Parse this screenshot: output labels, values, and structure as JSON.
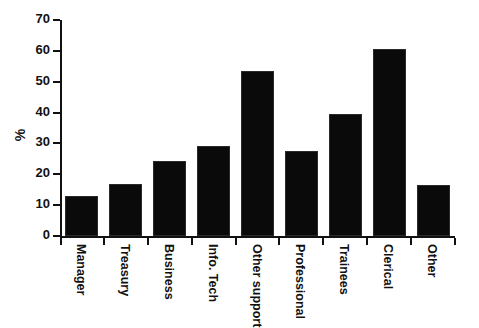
{
  "chart_data": {
    "type": "bar",
    "title": "",
    "xlabel": "",
    "ylabel": "%",
    "ylim": [
      0,
      70
    ],
    "ytick_step": 10,
    "yticks": [
      0,
      10,
      20,
      30,
      40,
      50,
      60,
      70
    ],
    "grid": false,
    "legend": null,
    "bar_color": "#0a0a0a",
    "background_color": "#ffffff",
    "axis_color": "#111111",
    "categories": [
      "Manager",
      "Treasury",
      "Business",
      "Info. Tech",
      "Other support",
      "Professional",
      "Trainees",
      "Clerical",
      "Other"
    ],
    "values": [
      13,
      17,
      24.3,
      29.3,
      53.5,
      27.5,
      39.5,
      60.7,
      16.5
    ]
  }
}
